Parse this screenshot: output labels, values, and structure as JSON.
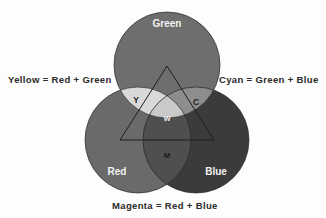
{
  "figure": {
    "background_color": "#fdfdfd",
    "text_color": "#2a2a2a"
  },
  "circles": {
    "green": {
      "label": "Green",
      "label_color": "#f2f2f2",
      "fill": "#6e6e6e",
      "cx": 167,
      "cy": 65,
      "r": 53,
      "label_x": 167,
      "label_y": 27
    },
    "red": {
      "label": "Red",
      "label_color": "#f2f2f2",
      "fill": "#6a6a6a",
      "cx": 138,
      "cy": 140,
      "r": 53,
      "label_x": 117,
      "label_y": 175
    },
    "blue": {
      "label": "Blue",
      "label_color": "#f2f2f2",
      "fill": "#3b3b3b",
      "cx": 196,
      "cy": 140,
      "r": 53,
      "label_x": 216,
      "label_y": 175
    }
  },
  "overlaps": {
    "yellow": {
      "label": "Y",
      "label_color": "#1d1d1d",
      "fill": "#d9d9d9",
      "label_x": 136,
      "label_y": 103
    },
    "cyan": {
      "label": "C",
      "label_color": "#1d1d1d",
      "fill": "#8d8d8d",
      "label_x": 196,
      "label_y": 105
    },
    "magenta": {
      "label": "M",
      "label_color": "#1d1d1d",
      "fill": "#4f4f4f",
      "label_x": 167,
      "label_y": 158
    },
    "white": {
      "label": "W",
      "label_color": "#efefef",
      "fill": "#c9c9c9",
      "label_x": 167,
      "label_y": 121
    }
  },
  "triangle": {
    "stroke": "#1f1f1f",
    "stroke_width": 1,
    "points": "167,66 214,140 120,140"
  },
  "equations": {
    "yellow": "Yellow = Red + Green",
    "cyan": "Cyan = Green + Blue",
    "magenta": "Magenta = Red + Blue"
  }
}
